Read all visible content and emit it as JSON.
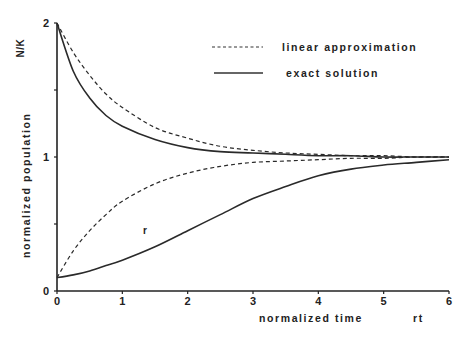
{
  "chart_data": {
    "type": "line",
    "title": "",
    "xlabel": "normalized time",
    "xlabel_unit": "rt",
    "ylabel": "normalized population",
    "ylabel_symbol": "N/K",
    "xlim": [
      0,
      6
    ],
    "ylim": [
      0,
      2
    ],
    "x_ticks": [
      "0",
      "1",
      "2",
      "3",
      "4",
      "5",
      "6"
    ],
    "y_ticks": [
      "0",
      "1",
      "2"
    ],
    "grid": false,
    "legend_position": "upper right",
    "legend": [
      {
        "label": "linear approximation",
        "style": "dashed"
      },
      {
        "label": "exact solution",
        "style": "solid"
      }
    ],
    "annotations": [
      {
        "text": "r",
        "x": 1.35,
        "y": 0.55
      }
    ],
    "x": [
      0,
      0.25,
      0.5,
      0.75,
      1,
      1.5,
      2,
      2.5,
      3,
      3.5,
      4,
      4.5,
      5,
      5.5,
      6
    ],
    "series": [
      {
        "name": "linear approximation (N0=2)",
        "style": "dashed",
        "values": [
          2.0,
          1.78,
          1.61,
          1.47,
          1.37,
          1.22,
          1.14,
          1.08,
          1.05,
          1.03,
          1.02,
          1.01,
          1.01,
          1.0,
          1.0
        ]
      },
      {
        "name": "exact solution (N0=2)",
        "style": "solid",
        "values": [
          2.0,
          1.64,
          1.44,
          1.31,
          1.23,
          1.13,
          1.07,
          1.04,
          1.03,
          1.02,
          1.01,
          1.01,
          1.0,
          1.0,
          1.0
        ]
      },
      {
        "name": "linear approximation (N0=0.1)",
        "style": "dashed",
        "values": [
          0.1,
          0.3,
          0.45,
          0.57,
          0.67,
          0.8,
          0.88,
          0.93,
          0.96,
          0.97,
          0.98,
          0.99,
          0.99,
          1.0,
          1.0
        ]
      },
      {
        "name": "exact solution (N0=0.1)",
        "style": "solid",
        "values": [
          0.1,
          0.12,
          0.15,
          0.19,
          0.23,
          0.33,
          0.45,
          0.57,
          0.69,
          0.78,
          0.86,
          0.91,
          0.94,
          0.96,
          0.98
        ]
      }
    ]
  }
}
